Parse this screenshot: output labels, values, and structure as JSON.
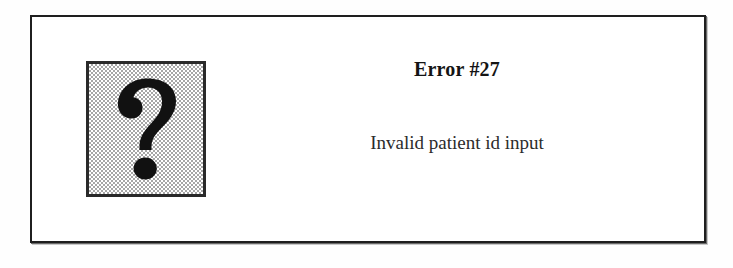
{
  "dialog": {
    "title": "Error #27",
    "message": "Invalid patient id input",
    "icon": {
      "name": "question-mark-icon",
      "glyph": "?"
    },
    "colors": {
      "frame_border": "#1f1f1f",
      "frame_background": "#ffffff",
      "icon_border": "#2a2a2a",
      "icon_background_dither": "#a6a6a6",
      "icon_glyph": "#111111",
      "title_text": "#141414",
      "message_text": "#2b2b2b",
      "page_background": "#ffffff"
    }
  }
}
